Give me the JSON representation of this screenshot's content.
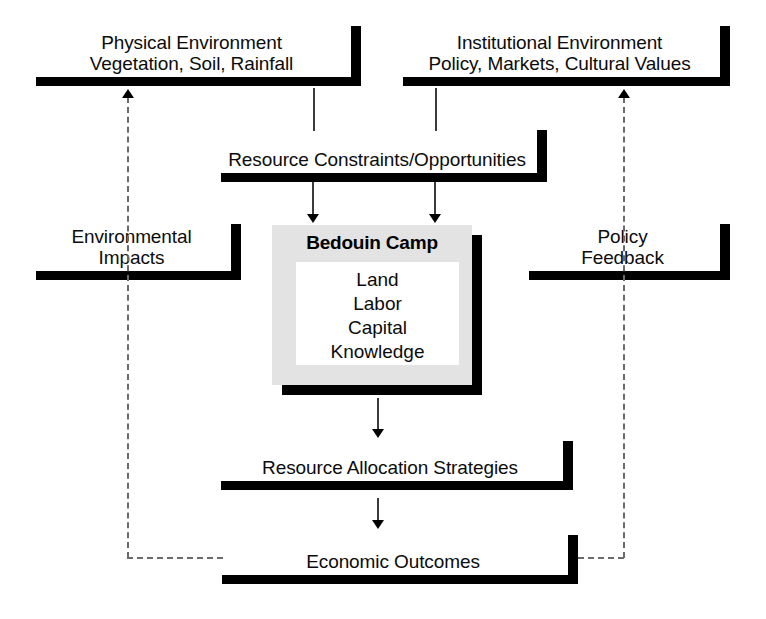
{
  "diagram": {
    "colors": {
      "background": "#ffffff",
      "rule": "#000000",
      "camp_fill": "#e3e3e3",
      "camp_inner_fill": "#ffffff",
      "connector": "#3b3b3b",
      "feedback_dash": "#6a6a6a"
    },
    "nodes": {
      "physical_environment": {
        "label": "Physical Environment\nVegetation, Soil, Rainfall",
        "line1": "Physical Environment",
        "line2": "Vegetation, Soil, Rainfall"
      },
      "institutional_environment": {
        "label": "Institutional Environment\nPolicy, Markets, Cultural Values",
        "line1": "Institutional Environment",
        "line2": "Policy, Markets, Cultural Values"
      },
      "resource_constraints": {
        "label": "Resource Constraints/Opportunities"
      },
      "environmental_impacts": {
        "label": "Environmental\nImpacts",
        "line1": "Environmental",
        "line2": "Impacts"
      },
      "policy_feedback": {
        "label": "Policy\nFeedback",
        "line1": "Policy",
        "line2": "Feedback"
      },
      "bedouin_camp": {
        "title": "Bedouin Camp",
        "resources": "Land\nLabor\nCapital\nKnowledge",
        "resource_items": [
          "Land",
          "Labor",
          "Capital",
          "Knowledge"
        ]
      },
      "resource_allocation": {
        "label": "Resource Allocation Strategies"
      },
      "economic_outcomes": {
        "label": "Economic Outcomes"
      }
    },
    "edges": [
      {
        "from": "physical_environment",
        "to": "resource_constraints",
        "style": "solid-line"
      },
      {
        "from": "institutional_environment",
        "to": "resource_constraints",
        "style": "solid-line"
      },
      {
        "from": "resource_constraints",
        "to": "bedouin_camp",
        "style": "solid-arrow-down"
      },
      {
        "from": "resource_constraints",
        "to": "bedouin_camp",
        "style": "solid-arrow-down"
      },
      {
        "from": "bedouin_camp",
        "to": "resource_allocation",
        "style": "solid-arrow-down"
      },
      {
        "from": "resource_allocation",
        "to": "economic_outcomes",
        "style": "solid-arrow-down"
      },
      {
        "from": "economic_outcomes",
        "to": "physical_environment",
        "style": "dashed-arrow-up",
        "via": "environmental_impacts"
      },
      {
        "from": "economic_outcomes",
        "to": "institutional_environment",
        "style": "dashed-arrow-up",
        "via": "policy_feedback"
      }
    ]
  }
}
